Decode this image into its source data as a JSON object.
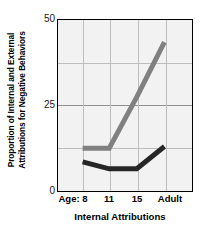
{
  "chart_data": {
    "type": "line",
    "title": "",
    "xlabel": "Internal Attributions",
    "ylabel_line1": "Proportion of Internal and External",
    "ylabel_line2": "Attributions for Negative Behaviors",
    "categories": [
      "Age: 8",
      "11",
      "15",
      "Adult"
    ],
    "ytick_labels": [
      "50",
      "25",
      "0"
    ],
    "ytick_values": [
      50,
      25,
      0
    ],
    "ylim": [
      0,
      50
    ],
    "grid": true,
    "legend": "none",
    "series": [
      {
        "name": "external-attributions",
        "color": "#808080",
        "values": [
          12.5,
          12.5,
          27.5,
          43.5
        ]
      },
      {
        "name": "internal-attributions",
        "color": "#262626",
        "values": [
          8.5,
          6.5,
          6.5,
          13.0
        ]
      }
    ]
  },
  "colors": {
    "plot_background": "#f2f2f2",
    "frame": "#000000",
    "grid_minor": "#bdbdbd",
    "grid_major": "#8f8f8f",
    "series_light": "#808080",
    "series_dark": "#262626"
  }
}
